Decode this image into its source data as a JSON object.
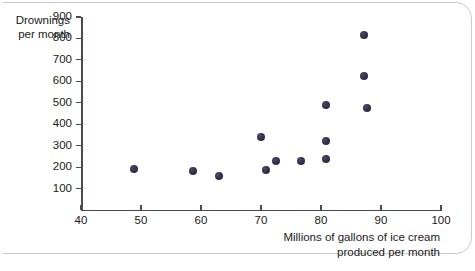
{
  "figure": {
    "background_color": "#ffffff",
    "border_color": "#c9c9cc"
  },
  "chart_data": {
    "type": "scatter",
    "title": "",
    "xlabel": "Millions of gallons of ice cream produced per month",
    "ylabel": "Drownings per month",
    "ylabel_line1": "Drownings",
    "ylabel_line2": "per month",
    "xlabel_line1": "Millions of gallons of ice cream",
    "xlabel_line2": "produced per month",
    "xlim": [
      40,
      100
    ],
    "ylim": [
      0,
      900
    ],
    "xticks": [
      40,
      50,
      60,
      70,
      80,
      90,
      100
    ],
    "yticks": [
      100,
      200,
      300,
      400,
      500,
      600,
      700,
      800,
      900
    ],
    "xtick_labels": [
      "40",
      "50",
      "60",
      "70",
      "80",
      "90",
      "100"
    ],
    "ytick_labels": [
      "100",
      "200",
      "300",
      "400",
      "500",
      "600",
      "700",
      "800",
      "900"
    ],
    "grid": false,
    "legend": false,
    "marker_color": "#2b2b45",
    "points": [
      {
        "x": 48.8,
        "y": 190
      },
      {
        "x": 58.7,
        "y": 180
      },
      {
        "x": 63.0,
        "y": 160
      },
      {
        "x": 70.0,
        "y": 340
      },
      {
        "x": 70.9,
        "y": 185
      },
      {
        "x": 72.5,
        "y": 230
      },
      {
        "x": 76.7,
        "y": 230
      },
      {
        "x": 80.8,
        "y": 490
      },
      {
        "x": 80.8,
        "y": 320
      },
      {
        "x": 80.8,
        "y": 240
      },
      {
        "x": 87.2,
        "y": 815
      },
      {
        "x": 87.2,
        "y": 625
      },
      {
        "x": 87.6,
        "y": 475
      }
    ]
  }
}
